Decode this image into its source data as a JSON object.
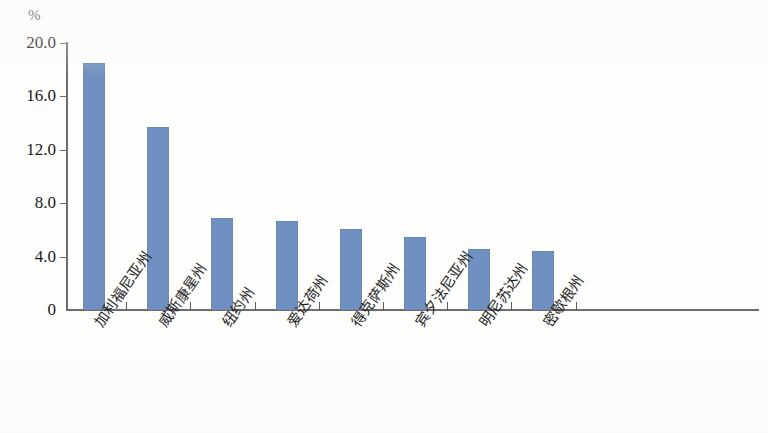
{
  "chart_data": {
    "type": "bar",
    "title": "",
    "subtitle": "",
    "xlabel": "",
    "ylabel": "%",
    "unit_label": "%",
    "categories": [
      "加利福尼亚州",
      "威斯康星州",
      "纽约州",
      "爱达荷州",
      "得克萨斯州",
      "宾夕法尼亚州",
      "明尼苏达州",
      "密歇根州"
    ],
    "values": [
      18.5,
      13.7,
      6.9,
      6.7,
      6.1,
      5.5,
      4.6,
      4.4
    ],
    "ytick_labels": [
      "20.0",
      "16.0",
      "12.0",
      "8.0",
      "4.0",
      "0"
    ],
    "ytick_values": [
      20.0,
      16.0,
      12.0,
      8.0,
      4.0,
      0
    ],
    "ylim": [
      0,
      20.6
    ],
    "grid": false,
    "legend": null,
    "bar_color": "#7190c2",
    "axis_color": "#6d6d6d",
    "text_color": "#1a1a1a"
  }
}
